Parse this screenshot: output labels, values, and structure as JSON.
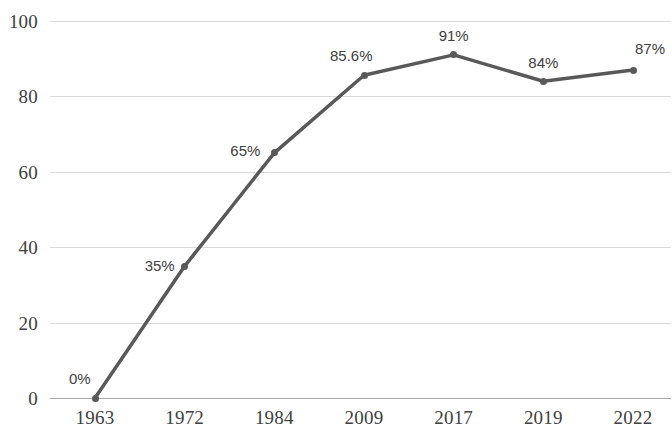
{
  "chart_data": {
    "type": "line",
    "title": "",
    "xlabel": "",
    "ylabel": "",
    "categories": [
      "1963",
      "1972",
      "1984",
      "2009",
      "2017",
      "2019",
      "2022"
    ],
    "values": [
      0,
      35,
      65,
      85.6,
      91,
      84,
      87
    ],
    "point_labels": [
      "0%",
      "35%",
      "65%",
      "85.6%",
      "91%",
      "84%",
      "87%"
    ],
    "ylim": [
      0,
      100
    ],
    "yticks": [
      0,
      20,
      40,
      60,
      80,
      100
    ],
    "ytick_labels": [
      "0",
      "20",
      "40",
      "60",
      "80",
      "100"
    ],
    "grid": true,
    "grid_axis": "y",
    "legend": false,
    "legend_position": "none",
    "series": [
      {
        "name": "",
        "values": [
          0,
          35,
          65,
          85.6,
          91,
          84,
          87
        ],
        "color": "#595959",
        "marker": "circle",
        "line_width": 3.5
      }
    ]
  },
  "colors": {
    "series": "#595959",
    "gridline": "#d9d9d9",
    "axis": "#a6a6a6",
    "tick_text": "#404040",
    "label_text": "#404040",
    "background": "#ffffff"
  },
  "label_offsets": [
    {
      "dx": -26,
      "dy": -27
    },
    {
      "dx": -40,
      "dy": -8
    },
    {
      "dx": -44,
      "dy": -10
    },
    {
      "dx": -34,
      "dy": -27
    },
    {
      "dx": 0,
      "dy": -27
    },
    {
      "dx": 0,
      "dy": -26
    },
    {
      "dx": 2,
      "dy": -29
    }
  ]
}
